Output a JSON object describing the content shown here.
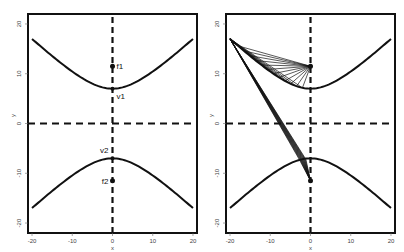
{
  "chart_data": [
    {
      "type": "line",
      "panel": "left",
      "title": "",
      "xlabel": "x",
      "ylabel": "y",
      "xlim": [
        -21,
        21
      ],
      "ylim": [
        -22,
        22
      ],
      "xticks": [
        -20,
        -10,
        0,
        10,
        20
      ],
      "yticks": [
        -20,
        -10,
        0,
        10,
        20
      ],
      "grid": false,
      "series": [
        {
          "name": "upper branch",
          "x": [
            -20,
            -15,
            -10,
            -5,
            0,
            5,
            10,
            15,
            20
          ],
          "y": [
            17,
            13.5,
            10.3,
            7.9,
            7,
            7.9,
            10.3,
            13.5,
            17
          ]
        },
        {
          "name": "lower branch",
          "x": [
            -20,
            -15,
            -10,
            -5,
            0,
            5,
            10,
            15,
            20
          ],
          "y": [
            -17,
            -13.5,
            -10.3,
            -7.9,
            -7,
            -7.9,
            -10.3,
            -13.5,
            -17
          ]
        }
      ],
      "reference_lines": [
        {
          "orientation": "vertical",
          "at": 0,
          "style": "dashed"
        },
        {
          "orientation": "horizontal",
          "at": 0,
          "style": "dashed"
        }
      ],
      "points": [
        {
          "label": "f1",
          "x": 0,
          "y": 11.5
        },
        {
          "label": "v1",
          "x": 0,
          "y": 7
        },
        {
          "label": "v2",
          "x": 0,
          "y": -7
        },
        {
          "label": "f2",
          "x": 0,
          "y": -11.5
        }
      ]
    },
    {
      "type": "line",
      "panel": "right",
      "title": "",
      "xlabel": "x",
      "ylabel": "y",
      "xlim": [
        -21,
        21
      ],
      "ylim": [
        -22,
        22
      ],
      "xticks": [
        -20,
        -10,
        0,
        10,
        20
      ],
      "yticks": [
        -20,
        -10,
        0,
        10,
        20
      ],
      "grid": false,
      "series": [
        {
          "name": "upper branch",
          "x": [
            -20,
            -15,
            -10,
            -5,
            0,
            5,
            10,
            15,
            20
          ],
          "y": [
            17,
            13.5,
            10.3,
            7.9,
            7,
            7.9,
            10.3,
            13.5,
            17
          ]
        },
        {
          "name": "lower branch",
          "x": [
            -20,
            -15,
            -10,
            -5,
            0,
            5,
            10,
            15,
            20
          ],
          "y": [
            -17,
            -13.5,
            -10.3,
            -7.9,
            -7,
            -7.9,
            -10.3,
            -13.5,
            -17
          ]
        }
      ],
      "reference_lines": [
        {
          "orientation": "vertical",
          "at": 0,
          "style": "dashed"
        },
        {
          "orientation": "horizontal",
          "at": 0,
          "style": "dashed"
        }
      ],
      "points": [
        {
          "label": "f1",
          "x": 0,
          "y": 11.5
        },
        {
          "label": "f2",
          "x": 0,
          "y": -11.5
        }
      ],
      "annotation": "Fan of line segments from point (-20, 17) to points along the upper branch, then continuing to f1 (0, 11.5) and f2 (0, -11.5)",
      "fan_origin": {
        "x": -20,
        "y": 17
      },
      "fan_count": 12
    }
  ],
  "labels": {
    "f1": "f1",
    "v1": "v1",
    "v2": "v2",
    "f2": "f2",
    "x_axis": "x",
    "y_axis": "y",
    "ticks": [
      "-20",
      "-10",
      "0",
      "10",
      "20"
    ],
    "yticks": [
      "20",
      "10",
      "0",
      "-10",
      "-20"
    ]
  }
}
